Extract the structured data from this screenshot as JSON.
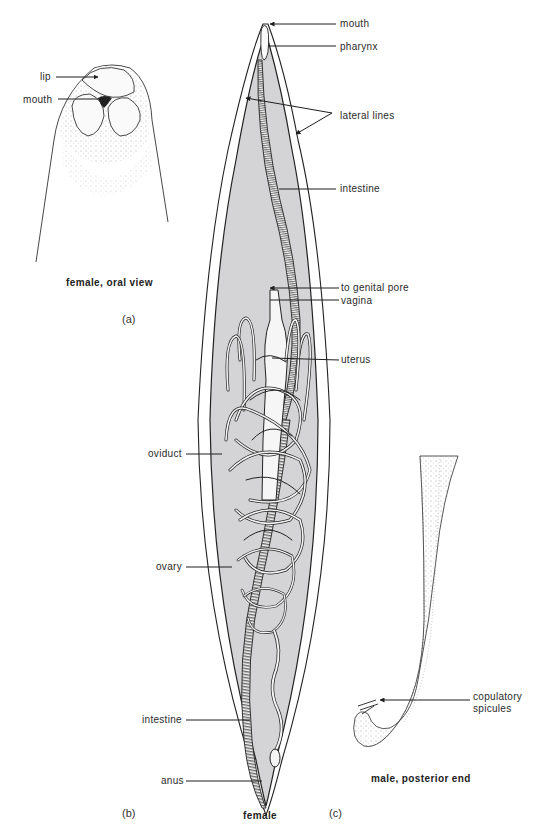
{
  "figure": {
    "panels": {
      "a": {
        "id_label": "(a)",
        "caption": "female, oral view",
        "labels": {
          "lip": "lip",
          "mouth": "mouth"
        }
      },
      "b": {
        "id_label": "(b)",
        "caption": "female",
        "labels": {
          "mouth": "mouth",
          "pharynx": "pharynx",
          "lateral_lines": "lateral lines",
          "intestine_upper": "intestine",
          "to_genital_pore": "to genital pore",
          "vagina": "vagina",
          "uterus": "uterus",
          "oviduct": "oviduct",
          "ovary": "ovary",
          "intestine_lower": "intestine",
          "anus": "anus"
        }
      },
      "c": {
        "id_label": "(c)",
        "caption": "male, posterior end",
        "labels": {
          "copulatory_spicules_line1": "copulatory",
          "copulatory_spicules_line2": "spicules"
        }
      }
    },
    "colors": {
      "body_fill": "#d4d4d6",
      "line": "#1e1e1e",
      "organ_fill": "#f4f4f4"
    }
  }
}
